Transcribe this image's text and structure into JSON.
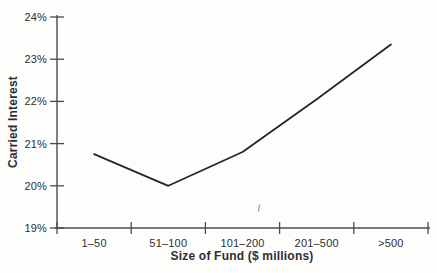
{
  "figure": {
    "background": "#fdfdfc",
    "line_color": "#26262a",
    "axis_color": "#4b4b4f",
    "text_color": "#2e2e32"
  },
  "chart_data": {
    "type": "line",
    "categories": [
      "1–50",
      "51–100",
      "101–200",
      "201–500",
      ">500"
    ],
    "values": [
      20.75,
      20.0,
      20.8,
      22.05,
      23.35
    ],
    "xlabel": "Size of Fund ($ millions)",
    "ylabel": "Carried Interest",
    "y_tick_labels": [
      "19%",
      "20%",
      "21%",
      "22%",
      "23%",
      "24%"
    ],
    "ylim": [
      19,
      24
    ],
    "unit": "%",
    "grid": false,
    "legend": "none"
  }
}
